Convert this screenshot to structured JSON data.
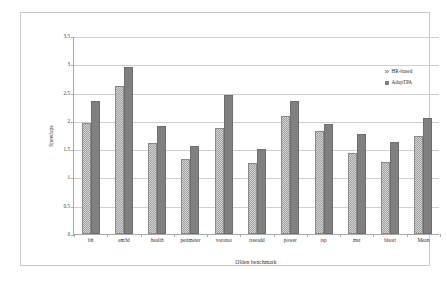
{
  "chart_data": {
    "type": "bar",
    "title": "",
    "xlabel": "Olden benchmark",
    "ylabel": "Speedups",
    "ylim": [
      0,
      3.5
    ],
    "ytick_labels": [
      "0",
      "0.5",
      "1",
      "1.5",
      "2",
      "2.5",
      "3",
      "3.5"
    ],
    "ytick_values": [
      0,
      0.5,
      1,
      1.5,
      2,
      2.5,
      3,
      3.5
    ],
    "grid": true,
    "legend_position": "upper right",
    "categories": [
      "bh",
      "em3d",
      "health",
      "perimeter",
      "voronoi",
      "treeadd",
      "power",
      "tsp",
      "mst",
      "bisort",
      "Mean"
    ],
    "series": [
      {
        "name": "HR-based",
        "color": "#a0a0a0",
        "pattern": "checkered",
        "values": [
          1.97,
          2.61,
          1.61,
          1.32,
          1.88,
          1.25,
          2.09,
          1.82,
          1.44,
          1.28,
          1.73
        ]
      },
      {
        "name": "AdapTPA",
        "color": "#808080",
        "pattern": "solid",
        "values": [
          2.35,
          2.95,
          1.91,
          1.56,
          2.45,
          1.51,
          2.36,
          1.95,
          1.76,
          1.63,
          2.05
        ]
      }
    ]
  }
}
